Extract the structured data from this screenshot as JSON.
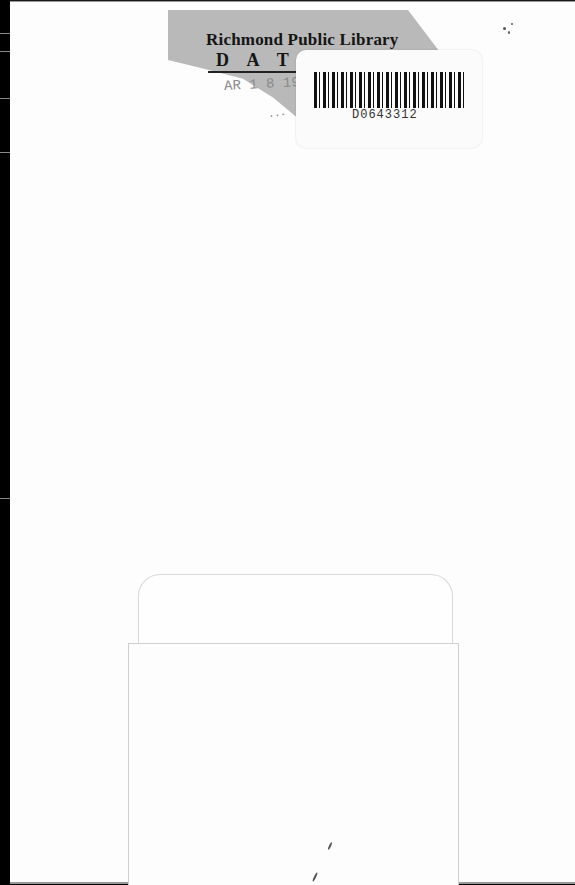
{
  "scan": {
    "type": "book back cover scan",
    "background_color": "#fdfdfd",
    "border_color": "#000000"
  },
  "due_date_label": {
    "library_name": "Richmond Public Library",
    "heading": "DATE",
    "heading_visible": "D A T",
    "stamp_partial": "AR 1 8 19",
    "stamp_partial_2": "...",
    "label_color": "#b9b9b9"
  },
  "barcode_sticker": {
    "number": "D0643312"
  },
  "card_pocket": {
    "description": "empty library card pocket with card"
  }
}
